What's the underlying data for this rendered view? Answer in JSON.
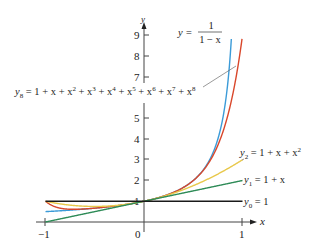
{
  "chart_data": {
    "type": "line",
    "title": "",
    "xlabel": "x",
    "ylabel": "y",
    "xlim": [
      -1,
      1
    ],
    "ylim": [
      0,
      9.5
    ],
    "x_ticks": [
      -1,
      0,
      1
    ],
    "x_tick_labels": [
      "−1",
      "0",
      "1"
    ],
    "y_ticks": [
      1,
      2,
      3,
      4,
      5,
      6,
      7,
      8,
      9
    ],
    "y_tick_labels": [
      "1",
      "2",
      "3",
      "4",
      "5",
      "",
      "7",
      "8",
      "9"
    ],
    "grid": false,
    "legend": "inline labels",
    "series": [
      {
        "name": "y = 1/(1 − x)",
        "formula": "1/(1-x)",
        "color": "#3b9bd8",
        "x": [
          -1,
          -0.5,
          0,
          0.25,
          0.5,
          0.6,
          0.7,
          0.8,
          0.85,
          0.89
        ],
        "y": [
          0.5,
          0.667,
          1,
          1.333,
          2,
          2.5,
          3.333,
          5,
          6.667,
          9.09
        ]
      },
      {
        "name": "y8 = 1 + x + x^2 + x^3 + x^4 + x^5 + x^6 + x^7 + x^8",
        "formula": "sum_{k=0}^{8} x^k",
        "color": "#d9472b",
        "x": [
          -1,
          -0.5,
          0,
          0.25,
          0.5,
          0.6,
          0.7,
          0.8,
          0.9,
          0.95
        ],
        "y": [
          1,
          0.668,
          1,
          1.333,
          1.996,
          2.475,
          3.201,
          4.329,
          6.126,
          7.4
        ]
      },
      {
        "name": "y2 = 1 + x + x^2",
        "formula": "1+x+x^2",
        "color": "#e8c84a",
        "x": [
          -1,
          -0.5,
          0,
          0.5,
          1
        ],
        "y": [
          1,
          0.75,
          1,
          1.75,
          3
        ]
      },
      {
        "name": "y1 = 1 + x",
        "formula": "1+x",
        "color": "#2e8b57",
        "x": [
          -1,
          0,
          1
        ],
        "y": [
          0,
          1,
          2
        ]
      },
      {
        "name": "y0 = 1",
        "formula": "1",
        "color": "#1a1a1a",
        "x": [
          -1,
          0,
          1
        ],
        "y": [
          1,
          1,
          1
        ]
      }
    ],
    "annotations": [
      "y = 1/(1 − x)",
      "y8 = 1 + x + x^2 + x^3 + x^4 + x^5 + x^6 + x^7 + x^8",
      "y2 = 1 + x + x^2",
      "y1 = 1 + x",
      "y0 = 1"
    ]
  },
  "labels": {
    "axis_x": "x",
    "axis_y": "y",
    "tick_neg1": "−1",
    "tick_0": "0",
    "tick_1": "1",
    "ytick_1": "1",
    "ytick_2": "2",
    "ytick_3": "3",
    "ytick_4": "4",
    "ytick_5": "5",
    "ytick_7": "7",
    "ytick_8": "8",
    "ytick_9": "9",
    "geo_lhs": "y = ",
    "geo_num": "1",
    "geo_den": "1 − x",
    "y0": "y",
    "y0_sub": "0",
    "y0_rhs": " = 1",
    "y1": "y",
    "y1_sub": "1",
    "y1_rhs": " = 1 + x",
    "y2": "y",
    "y2_sub": "2",
    "y2_rhs": " = 1 + x + x",
    "y2_sup": "2",
    "y8": "y",
    "y8_sub": "8",
    "y8_rhs_parts": [
      " = 1 + x + x",
      "2",
      " + x",
      "3",
      " + x",
      "4",
      " + x",
      "5",
      " + x",
      "6",
      " + x",
      "7",
      " + x",
      "8"
    ]
  },
  "colors": {
    "geometric": "#3b9bd8",
    "y8": "#d9472b",
    "y2": "#e8c84a",
    "y1": "#2e8b57",
    "y0": "#1a1a1a",
    "axis": "#444444"
  }
}
